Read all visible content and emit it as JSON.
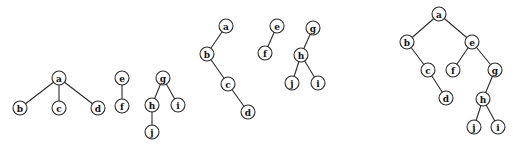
{
  "diagram": {
    "type": "forest-to-binary-tree",
    "node_radius": 7,
    "colors": {
      "stroke": "#2a2a2a",
      "fill": "#ffffff",
      "text": "#111111",
      "background": "#ffffff"
    },
    "groups": [
      {
        "name": "forest",
        "trees": [
          {
            "nodes": [
              {
                "id": "a",
                "label": "a",
                "x": 59,
                "y": 78
              },
              {
                "id": "b",
                "label": "b",
                "x": 20,
                "y": 108
              },
              {
                "id": "c",
                "label": "c",
                "x": 59,
                "y": 108
              },
              {
                "id": "d",
                "label": "d",
                "x": 98,
                "y": 108
              }
            ],
            "edges": [
              [
                "a",
                "b"
              ],
              [
                "a",
                "c"
              ],
              [
                "a",
                "d"
              ]
            ]
          },
          {
            "nodes": [
              {
                "id": "e",
                "label": "e",
                "x": 122,
                "y": 78
              },
              {
                "id": "f",
                "label": "f",
                "x": 122,
                "y": 106
              }
            ],
            "edges": [
              [
                "e",
                "f"
              ]
            ]
          },
          {
            "nodes": [
              {
                "id": "g",
                "label": "g",
                "x": 163,
                "y": 78
              },
              {
                "id": "h",
                "label": "h",
                "x": 152,
                "y": 105
              },
              {
                "id": "i",
                "label": "i",
                "x": 178,
                "y": 105
              },
              {
                "id": "j",
                "label": "j",
                "x": 152,
                "y": 132
              }
            ],
            "edges": [
              [
                "g",
                "h"
              ],
              [
                "g",
                "i"
              ],
              [
                "h",
                "j"
              ]
            ]
          }
        ]
      },
      {
        "name": "converted-trees",
        "trees": [
          {
            "nodes": [
              {
                "id": "a",
                "label": "a",
                "x": 226,
                "y": 26
              },
              {
                "id": "b",
                "label": "b",
                "x": 207,
                "y": 54
              },
              {
                "id": "c",
                "label": "c",
                "x": 228,
                "y": 84
              },
              {
                "id": "d",
                "label": "d",
                "x": 248,
                "y": 112
              }
            ],
            "edges": [
              [
                "a",
                "b"
              ],
              [
                "b",
                "c"
              ],
              [
                "c",
                "d"
              ]
            ]
          },
          {
            "nodes": [
              {
                "id": "e",
                "label": "e",
                "x": 277,
                "y": 26
              },
              {
                "id": "f",
                "label": "f",
                "x": 265,
                "y": 53
              }
            ],
            "edges": [
              [
                "e",
                "f"
              ]
            ]
          },
          {
            "nodes": [
              {
                "id": "g",
                "label": "g",
                "x": 313,
                "y": 28
              },
              {
                "id": "h",
                "label": "h",
                "x": 301,
                "y": 55
              },
              {
                "id": "j",
                "label": "j",
                "x": 292,
                "y": 83
              },
              {
                "id": "i",
                "label": "i",
                "x": 318,
                "y": 83
              }
            ],
            "edges": [
              [
                "g",
                "h"
              ],
              [
                "h",
                "j"
              ],
              [
                "h",
                "i"
              ]
            ]
          }
        ]
      },
      {
        "name": "binary-tree",
        "trees": [
          {
            "nodes": [
              {
                "id": "a",
                "label": "a",
                "x": 439,
                "y": 14
              },
              {
                "id": "b",
                "label": "b",
                "x": 407,
                "y": 42
              },
              {
                "id": "e",
                "label": "e",
                "x": 472,
                "y": 42
              },
              {
                "id": "c",
                "label": "c",
                "x": 428,
                "y": 70
              },
              {
                "id": "f",
                "label": "f",
                "x": 453,
                "y": 70
              },
              {
                "id": "g",
                "label": "g",
                "x": 495,
                "y": 70
              },
              {
                "id": "d",
                "label": "d",
                "x": 446,
                "y": 98
              },
              {
                "id": "h",
                "label": "h",
                "x": 483,
                "y": 99
              },
              {
                "id": "j",
                "label": "j",
                "x": 474,
                "y": 127
              },
              {
                "id": "i",
                "label": "i",
                "x": 498,
                "y": 127
              }
            ],
            "edges": [
              [
                "a",
                "b"
              ],
              [
                "a",
                "e"
              ],
              [
                "b",
                "c"
              ],
              [
                "c",
                "d"
              ],
              [
                "e",
                "f"
              ],
              [
                "e",
                "g"
              ],
              [
                "g",
                "h"
              ],
              [
                "h",
                "j"
              ],
              [
                "h",
                "i"
              ]
            ]
          }
        ]
      }
    ]
  }
}
